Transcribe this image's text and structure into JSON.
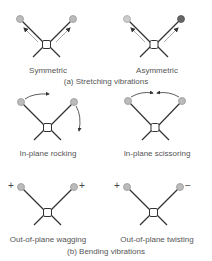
{
  "figure": {
    "section_a": {
      "caption": "(a) Stretching vibrations",
      "modes": [
        {
          "label": "Symmetric"
        },
        {
          "label": "Asymmetric"
        }
      ]
    },
    "section_b": {
      "caption": "(b) Bending vibrations",
      "modes": [
        {
          "label": "In-plane rocking"
        },
        {
          "label": "In-plane scissoring"
        },
        {
          "label": "Out-of-plane wagging",
          "signs": [
            "+",
            "+"
          ]
        },
        {
          "label": "Out-of-plane twisting",
          "signs": [
            "+",
            "−"
          ]
        }
      ]
    }
  },
  "colors": {
    "bond": "#333333",
    "atom_light": "#bbbbbb",
    "atom_dark": "#666666",
    "arrow": "#999999",
    "text": "#555555"
  }
}
